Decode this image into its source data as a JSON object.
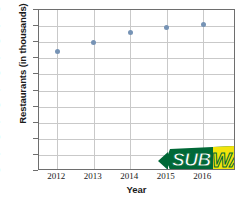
{
  "chart_data": {
    "type": "scatter",
    "title": "",
    "xlabel": "Year",
    "ylabel": "Restaurants (in thousands)",
    "categories": [
      "2012",
      "2013",
      "2014",
      "2015",
      "2016"
    ],
    "x": [
      2012,
      2013,
      2014,
      2015,
      2016
    ],
    "values": [
      37,
      40,
      43,
      44.5,
      45.5
    ],
    "series": [
      {
        "name": "Restaurants",
        "values": [
          37,
          40,
          43,
          44.5,
          45.5
        ]
      }
    ],
    "xlim": [
      2011.5,
      2016.9
    ],
    "ylim": [
      0,
      50
    ],
    "yticks": [
      50,
      45,
      40,
      35,
      30,
      25,
      20,
      15,
      10,
      5,
      0
    ],
    "xticks": [
      "2012",
      "2013",
      "2014",
      "2015",
      "2016"
    ],
    "grid": true,
    "legend": false,
    "marker_color": "#7693b5",
    "grid_color": "#c9c9c9",
    "frame_color": "#6e6e6e"
  },
  "watermark": {
    "name": "subway-logo",
    "text_part_1": "SUB",
    "text_part_2": "WAY",
    "registered_mark": "®",
    "green": "#006837",
    "yellow": "#f2e40b",
    "white": "#ffffff"
  }
}
